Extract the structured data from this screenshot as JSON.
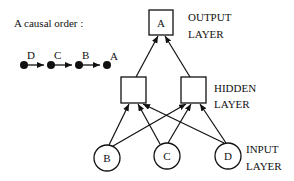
{
  "causal_order": {
    "title": "A causal order :",
    "sequence": [
      "D",
      "C",
      "B",
      "A"
    ]
  },
  "network": {
    "output_layer": {
      "label_line1": "OUTPUT",
      "label_line2": "LAYER",
      "nodes": [
        "A"
      ]
    },
    "hidden_layer": {
      "label_line1": "HIDDEN",
      "label_line2": "LAYER",
      "nodes": [
        "",
        ""
      ]
    },
    "input_layer": {
      "label_line1": "INPUT",
      "label_line2": "LAYER",
      "nodes": [
        "B",
        "C",
        "D"
      ]
    }
  },
  "colors": {
    "stroke": "#111111",
    "background": "#ffffff"
  }
}
